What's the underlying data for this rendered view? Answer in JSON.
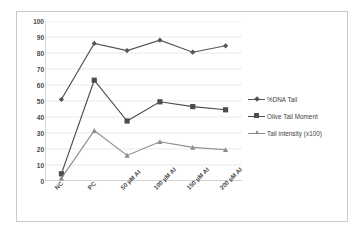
{
  "chart_data": {
    "type": "line",
    "title": "",
    "xlabel": "",
    "ylabel": "",
    "ylim": [
      0,
      100
    ],
    "ytick_step": 10,
    "yticks": [
      "100",
      "90",
      "80",
      "70",
      "60",
      "50",
      "40",
      "30",
      "20",
      "10",
      "0"
    ],
    "categories": [
      "NC",
      "PC",
      "50 µM AI",
      "100 µM AI",
      "150 µM AI",
      "200 µM AI"
    ],
    "grid": "horizontal",
    "legend_position": "right",
    "series": [
      {
        "name": "%DNA Tail",
        "marker": "diamond",
        "color": "#555555",
        "values": [
          51,
          86,
          81.5,
          88,
          80.5,
          84.5
        ]
      },
      {
        "name": "Olive Tail Moment",
        "marker": "square",
        "color": "#4d4d4d",
        "values": [
          4.5,
          63,
          37.5,
          49.5,
          46.5,
          44.5
        ]
      },
      {
        "name": "Tail intensity (x100)",
        "marker": "triangle",
        "color": "#8c8c8c",
        "values": [
          1.8,
          31.5,
          16,
          24.5,
          21,
          19.5
        ]
      }
    ]
  },
  "colors": {
    "frame": "#c9c9c9",
    "gridline": "#e3e3e3",
    "axis": "#b0b0b0",
    "tick_text": "#4a4a4a",
    "legend_text": "#3d3d3d",
    "background": "#ffffff"
  },
  "icons": {
    "diamond": "diamond-marker-icon",
    "square": "square-marker-icon",
    "triangle": "triangle-marker-icon"
  }
}
